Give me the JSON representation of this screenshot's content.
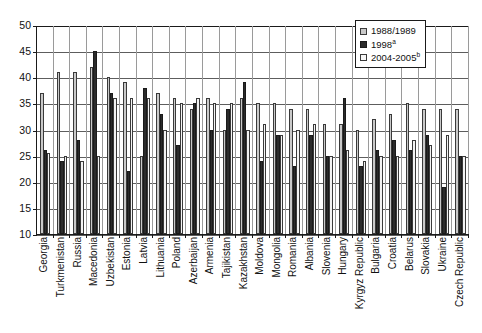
{
  "chart_data": {
    "type": "bar",
    "title": "",
    "subtitle": "",
    "xlabel": "",
    "ylabel": "",
    "ylim": [
      10,
      50
    ],
    "ytick_step": 5,
    "yticks": [
      10,
      15,
      20,
      25,
      30,
      35,
      40,
      45,
      50
    ],
    "grid": true,
    "legend_position": "top-right",
    "categories": [
      "Georgia",
      "Turkmenistan",
      "Russia",
      "Macedonia",
      "Uzbekistan",
      "Estonia",
      "Latvia",
      "Lithuania",
      "Poland",
      "Azerbaijan",
      "Armenia",
      "Tajikistan",
      "Kazakhstan",
      "Moldova",
      "Mongolia",
      "Romania",
      "Albania",
      "Slovenia",
      "Hungary",
      "Kyrgyz Republic",
      "Bulgaria",
      "Croatia",
      "Belarus",
      "Slovakia",
      "Ukraine",
      "Czech Republic"
    ],
    "series": [
      {
        "name": "1988/1989",
        "color": "#c9c9c9",
        "values": [
          37,
          41,
          41,
          42,
          40,
          39,
          25,
          37,
          36,
          34,
          36,
          30,
          36,
          35,
          35,
          34,
          34,
          31,
          31,
          30,
          32,
          33,
          35,
          34,
          34,
          34
        ]
      },
      {
        "name": "1998",
        "footnote": "a",
        "color": "#2b2b2b",
        "values": [
          26,
          24,
          28,
          45,
          37,
          22,
          38,
          33,
          27,
          35,
          30,
          34,
          39,
          24,
          29,
          23,
          29,
          25,
          36,
          23,
          26,
          28,
          26,
          29,
          19,
          25
        ]
      },
      {
        "name": "2004-2005",
        "footnote": "b",
        "color": "#f3f3f3",
        "values": [
          25.5,
          25,
          24,
          25,
          36,
          36,
          36,
          30,
          35,
          36,
          35,
          35,
          30,
          31,
          29,
          30,
          31,
          25,
          26,
          24,
          25,
          25,
          28,
          27,
          29,
          25
        ]
      }
    ]
  },
  "legend": {
    "items": [
      {
        "label": "1988/1989",
        "sup": ""
      },
      {
        "label": "1998",
        "sup": "a"
      },
      {
        "label": "2004-2005",
        "sup": "b"
      }
    ]
  },
  "axis": {
    "y_labels": [
      "50",
      "45",
      "40",
      "35",
      "30",
      "25",
      "20",
      "15",
      "10"
    ]
  }
}
